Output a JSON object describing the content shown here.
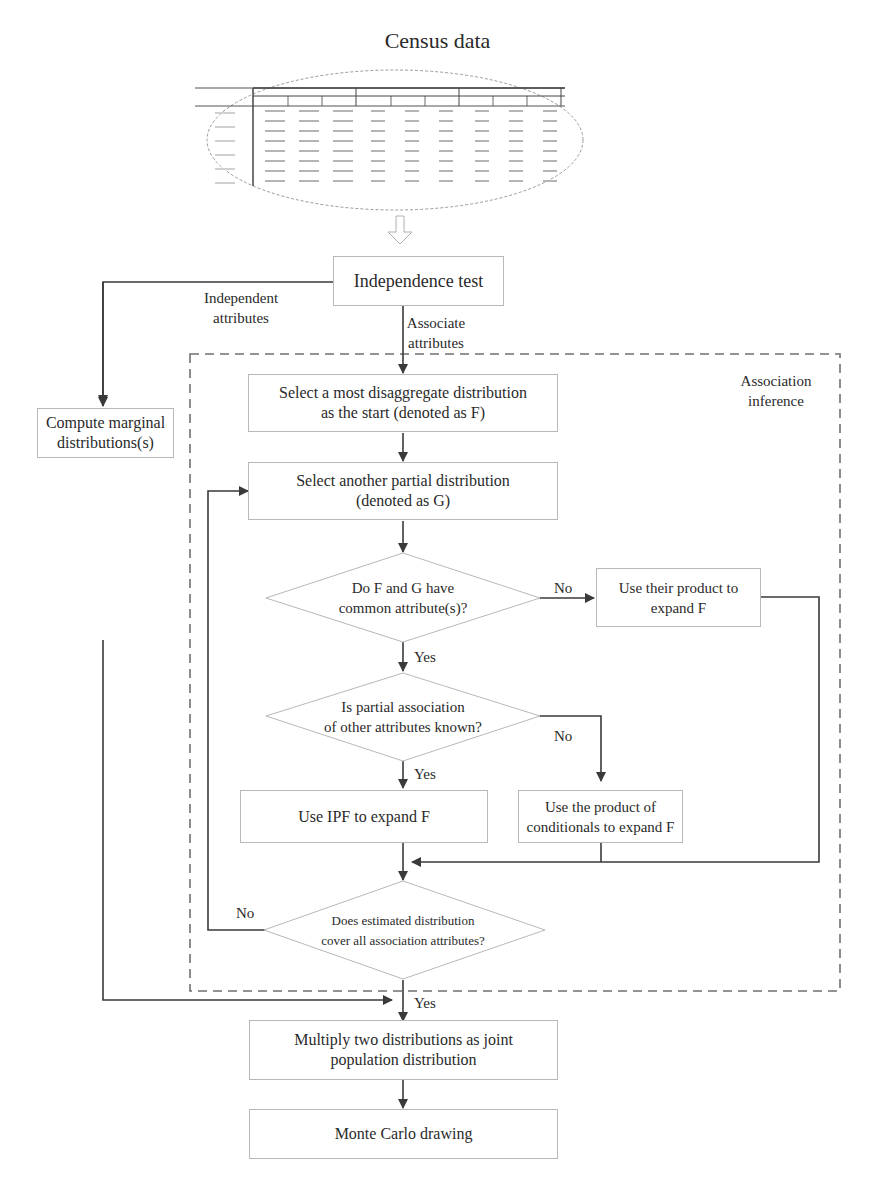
{
  "header": {
    "title": "Census data"
  },
  "census_table": {
    "group_headers": [
      "Group A",
      "Group B",
      "Group C"
    ],
    "rows": 8,
    "cols": 9
  },
  "nodes": {
    "independence_test": "Independence test",
    "compute_marginal": [
      "Compute marginal",
      "distributions(s)"
    ],
    "select_start": [
      "Select a most disaggregate distribution",
      "as the start (denoted as F)"
    ],
    "select_another": [
      "Select another partial distribution",
      "(denoted as G)"
    ],
    "decision_common": [
      "Do F and G have",
      "common attribute(s)?"
    ],
    "use_product": [
      "Use their product to",
      "expand F"
    ],
    "decision_partial": [
      "Is partial association",
      "of other attributes known?"
    ],
    "use_ipf": "Use IPF to expand F",
    "use_conditionals": [
      "Use the product of",
      "conditionals to expand F"
    ],
    "decision_cover": [
      "Does estimated distribution",
      "cover all association attributes?"
    ],
    "multiply": [
      "Multiply two distributions as joint",
      "population distribution"
    ],
    "monte_carlo": "Monte Carlo drawing"
  },
  "edge_labels": {
    "independent": [
      "Independent",
      "attributes"
    ],
    "associate": [
      "Associate",
      "attributes"
    ],
    "no_1": "No",
    "yes_1": "Yes",
    "no_2": "No",
    "yes_2": "Yes",
    "no_3": "No",
    "yes_3": "Yes"
  },
  "region": {
    "label": [
      "Association",
      "inference"
    ]
  },
  "colors": {
    "line": "#3a3a3a",
    "box_border": "#b8b8b8",
    "dashed": "#6a6a6a",
    "text": "#2a2a2a"
  }
}
